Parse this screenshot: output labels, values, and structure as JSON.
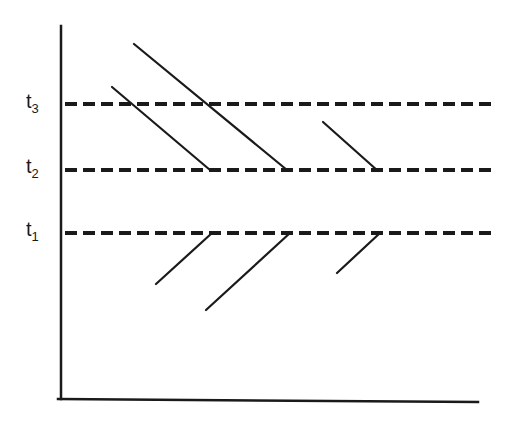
{
  "diagram": {
    "labels": [
      {
        "id": "t3",
        "base": "t",
        "sub": "3",
        "x": 26,
        "y": 91
      },
      {
        "id": "t2",
        "base": "t",
        "sub": "2",
        "x": 26,
        "y": 156
      },
      {
        "id": "t1",
        "base": "t",
        "sub": "1",
        "x": 26,
        "y": 219
      }
    ],
    "axes": {
      "y_axis": {
        "x": 61,
        "y1": 26,
        "y2": 399
      },
      "x_axis": {
        "x1": 58,
        "y1": 399,
        "x2": 478,
        "y2": 402
      }
    },
    "time_levels": [
      {
        "label": "t3",
        "y": 104
      },
      {
        "label": "t2",
        "y": 170
      },
      {
        "label": "t1",
        "y": 233
      }
    ],
    "dashed_line": {
      "x1": 65,
      "x2": 492,
      "dash": "12 6",
      "stroke_width": 4
    },
    "segments": [
      {
        "x1": 112,
        "y1": 87,
        "x2": 210,
        "y2": 170
      },
      {
        "x1": 134,
        "y1": 44,
        "x2": 287,
        "y2": 170
      },
      {
        "x1": 323,
        "y1": 122,
        "x2": 378,
        "y2": 171
      },
      {
        "x1": 156,
        "y1": 284,
        "x2": 212,
        "y2": 233
      },
      {
        "x1": 206,
        "y1": 310,
        "x2": 290,
        "y2": 233
      },
      {
        "x1": 337,
        "y1": 273,
        "x2": 380,
        "y2": 233
      }
    ],
    "colors": {
      "ink": "#1a1a1a",
      "background": "#ffffff"
    }
  }
}
